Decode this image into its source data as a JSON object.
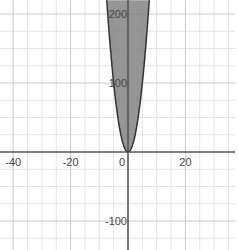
{
  "chart_data": {
    "type": "area",
    "title": "",
    "xlabel": "",
    "ylabel": "",
    "inequality": "y >= 4x^2",
    "function": {
      "kind": "parabola",
      "a": 4,
      "b": 0,
      "c": 0,
      "shade": "above"
    },
    "xlim": [
      -45,
      38
    ],
    "ylim": [
      -152,
      220
    ],
    "x_major_step": 20,
    "x_minor_step": 5,
    "y_major_step": 100,
    "y_minor_step": 25,
    "x_tick_labels": [
      {
        "value": -40,
        "label": "-40"
      },
      {
        "value": -20,
        "label": "-20"
      },
      {
        "value": 0,
        "label": "0"
      },
      {
        "value": 20,
        "label": "20"
      }
    ],
    "y_tick_labels": [
      {
        "value": 200,
        "label": "200"
      },
      {
        "value": 100,
        "label": "100"
      },
      {
        "value": -100,
        "label": "-100"
      }
    ],
    "grid": true,
    "fill_color": "#8a8a8a",
    "boundary_color": "#333333"
  }
}
